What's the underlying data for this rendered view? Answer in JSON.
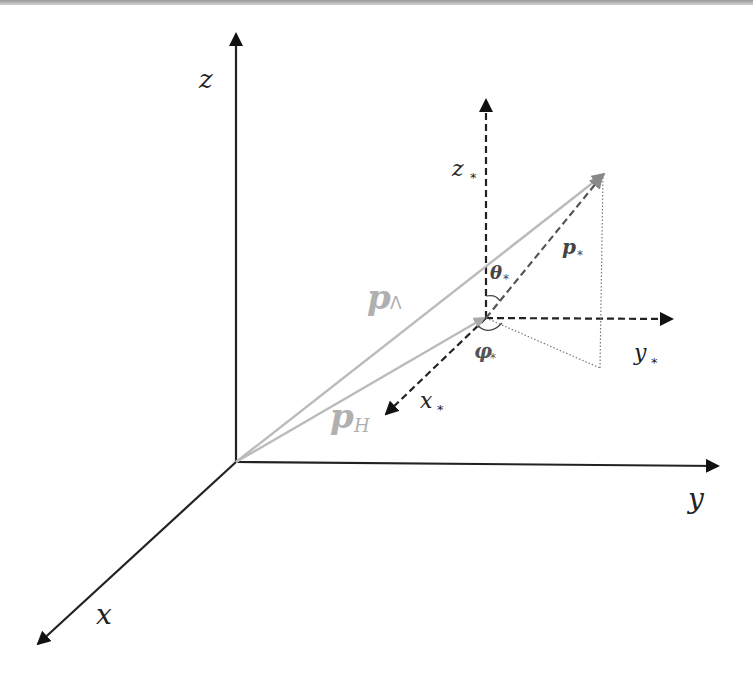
{
  "figure": {
    "colors": {
      "axis": "#111111",
      "frame_axis": "#222222",
      "vector_light": "#b8b8b8",
      "vector_dark": "#555555",
      "label_gray": "#aaaaaa",
      "top_rule": "#9a9a9a"
    },
    "axes": {
      "x": {
        "label": "x"
      },
      "y": {
        "label": "y"
      },
      "z": {
        "label": "z"
      }
    },
    "local_axes": {
      "x": {
        "label": "x",
        "subscript": "*"
      },
      "y": {
        "label": "y",
        "subscript": "*"
      },
      "z": {
        "label": "z",
        "subscript": "*"
      }
    },
    "vectors": {
      "p_lambda": {
        "label": "p",
        "subscript": "Λ"
      },
      "p_h": {
        "label": "p",
        "subscript": "H"
      },
      "p_star": {
        "label": "p",
        "subscript": "*"
      }
    },
    "angles": {
      "theta": {
        "label": "θ",
        "subscript": "*"
      },
      "phi": {
        "label": "φ",
        "subscript": "*"
      }
    }
  }
}
